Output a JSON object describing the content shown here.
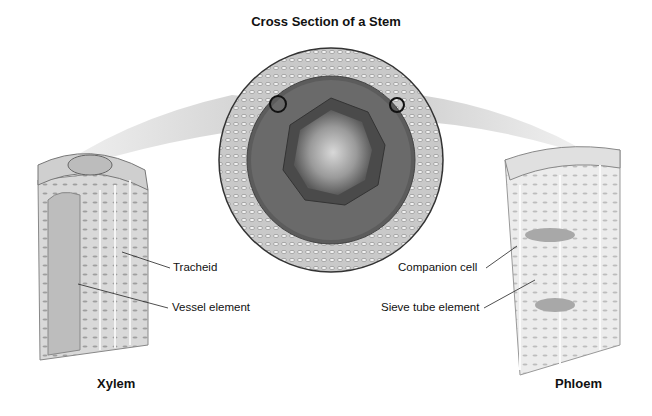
{
  "diagram": {
    "title": "Cross Section of a Stem",
    "cross_section": {
      "name": "stem-cross-section",
      "markers": [
        "xylem-location-marker",
        "phloem-location-marker"
      ]
    },
    "left": {
      "caption": "Xylem",
      "labels": [
        "Tracheid",
        "Vessel element"
      ]
    },
    "right": {
      "caption": "Phloem",
      "labels": [
        "Companion cell",
        "Sieve tube element"
      ]
    }
  },
  "colors": {
    "background": "#ffffff",
    "band": "#d8d8d8",
    "text": "#111111"
  }
}
